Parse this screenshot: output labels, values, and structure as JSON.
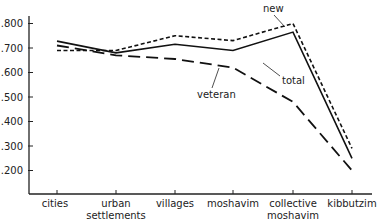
{
  "chart_data": {
    "type": "line",
    "title": "",
    "xlabel": "",
    "ylabel": "",
    "categories": [
      "cities",
      "urban settlements",
      "villages",
      "moshavim",
      "collective moshavim",
      "kibbutzim"
    ],
    "category_lines": [
      [
        "cities"
      ],
      [
        "urban",
        "settlements"
      ],
      [
        "villages"
      ],
      [
        "moshavim"
      ],
      [
        "collective",
        "moshavim"
      ],
      [
        "kibbutzim"
      ]
    ],
    "yticks": [
      ".200",
      ".300",
      ".400",
      ".500",
      ".600",
      ".700",
      ".800"
    ],
    "ylim": [
      0.1,
      0.8
    ],
    "grid": false,
    "legend": "inline annotations",
    "series": [
      {
        "name": "new",
        "style": "short-dash",
        "values": [
          0.69,
          0.69,
          0.75,
          0.73,
          0.8,
          0.29
        ]
      },
      {
        "name": "total",
        "style": "solid",
        "values": [
          0.728,
          0.68,
          0.715,
          0.69,
          0.765,
          0.25
        ]
      },
      {
        "name": "veteran",
        "style": "long-dash",
        "values": [
          0.71,
          0.67,
          0.655,
          0.62,
          0.48,
          0.2
        ]
      }
    ]
  }
}
